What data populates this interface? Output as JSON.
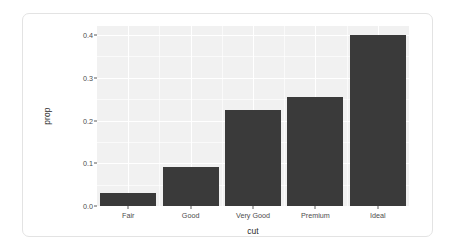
{
  "chart_data": {
    "type": "bar",
    "title": "",
    "subtitle": "",
    "xlabel": "cut",
    "ylabel": "prop",
    "categories": [
      "Fair",
      "Good",
      "Very Good",
      "Premium",
      "Ideal"
    ],
    "values": [
      0.0299,
      0.0905,
      0.224,
      0.2557,
      0.3995
    ],
    "series": [
      {
        "name": "prop",
        "values": [
          0.0299,
          0.0905,
          0.224,
          0.2557,
          0.3995
        ]
      }
    ],
    "ylim": [
      0,
      0.4212
    ],
    "xlim": [
      "Fair",
      "Ideal"
    ],
    "ytick_labels": [
      "0.0",
      "0.1",
      "0.2",
      "0.3",
      "0.4"
    ],
    "ytick_values": [
      0.0,
      0.1,
      0.2,
      0.3,
      0.4
    ],
    "yminor_values": [
      0.05,
      0.15,
      0.25,
      0.35
    ],
    "xtick_labels": [
      "Fair",
      "Good",
      "Very Good",
      "Premium",
      "Ideal"
    ],
    "grid": true,
    "grid_color": "#ffffff",
    "panel_background": "#f1f1f1",
    "bar_color": "#3a3a3a",
    "legend": null,
    "legend_position": "none",
    "annotations": []
  },
  "card": {
    "border_color": "#e3e3e3",
    "background": "#ffffff"
  }
}
